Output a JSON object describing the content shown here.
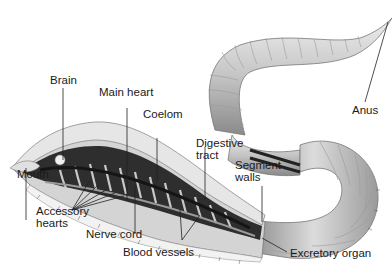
{
  "diagram": {
    "colors": {
      "body_light": "#e2e2e2",
      "body_mid": "#b9b9b9",
      "body_dark": "#7a7a7a",
      "interior_dark": "#2b2b2b",
      "vessel": "#1e1e1e",
      "leader_line": "#222222"
    },
    "labels": {
      "anus": "Anus",
      "brain": "Brain",
      "main_heart": "Main heart",
      "coelom": "Coelom",
      "digestive_tract_1": "Digestive",
      "digestive_tract_2": "tract",
      "segment_walls_1": "Segment",
      "segment_walls_2": "walls",
      "mouth": "Mouth",
      "accessory_hearts_1": "Accessory",
      "accessory_hearts_2": "hearts",
      "nerve_cord": "Nerve cord",
      "blood_vessels": "Blood vessels",
      "excretory_organ": "Excretory organ"
    }
  }
}
